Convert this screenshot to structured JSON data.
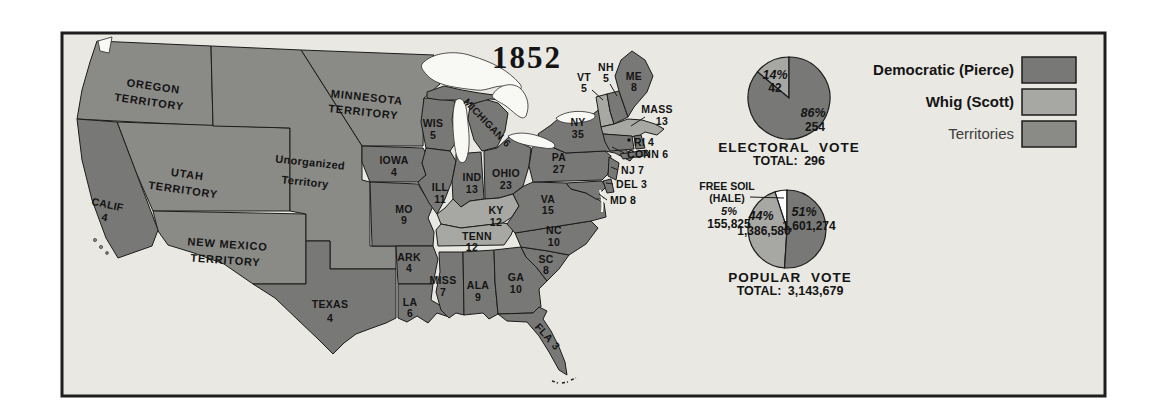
{
  "title": "1852",
  "colors": {
    "democratic": "#787876",
    "whig": "#a7a7a3",
    "territory": "#8a8a86",
    "freesoil": "#ffffff",
    "background": "#e9e8e3",
    "lake": "#f8f8f4",
    "outline": "#1b1b1b"
  },
  "legend": {
    "items": [
      {
        "label": "Democratic (Pierce)",
        "party": "democratic"
      },
      {
        "label": "Whig (Scott)",
        "party": "whig"
      },
      {
        "label": "Territories",
        "party": "territory"
      }
    ]
  },
  "map": {
    "states": {
      "calif": {
        "label": "CALIF",
        "votes": "4",
        "party": "democratic"
      },
      "texas": {
        "label": "TEXAS",
        "votes": "4",
        "party": "democratic"
      },
      "iowa": {
        "label": "IOWA",
        "votes": "4",
        "party": "democratic"
      },
      "wis": {
        "label": "WIS",
        "votes": "5",
        "party": "democratic"
      },
      "ill": {
        "label": "ILL",
        "votes": "11",
        "party": "democratic"
      },
      "mo": {
        "label": "MO",
        "votes": "9",
        "party": "democratic"
      },
      "ark": {
        "label": "ARK",
        "votes": "4",
        "party": "democratic"
      },
      "la": {
        "label": "LA",
        "votes": "6",
        "party": "democratic"
      },
      "miss": {
        "label": "MISS",
        "votes": "7",
        "party": "democratic"
      },
      "ala": {
        "label": "ALA",
        "votes": "9",
        "party": "democratic"
      },
      "ga": {
        "label": "GA",
        "votes": "10",
        "party": "democratic"
      },
      "fla": {
        "label": "FLA",
        "votes": "3",
        "party": "democratic"
      },
      "tenn": {
        "label": "TENN",
        "votes": "12",
        "party": "whig"
      },
      "ky": {
        "label": "KY",
        "votes": "12",
        "party": "whig"
      },
      "mich": {
        "label": "MICHIGAN",
        "votes": "6",
        "party": "democratic"
      },
      "ind": {
        "label": "IND",
        "votes": "13",
        "party": "democratic"
      },
      "ohio": {
        "label": "OHIO",
        "votes": "23",
        "party": "democratic"
      },
      "pa": {
        "label": "PA",
        "votes": "27",
        "party": "democratic"
      },
      "ny": {
        "label": "NY",
        "votes": "35",
        "party": "democratic"
      },
      "va": {
        "label": "VA",
        "votes": "15",
        "party": "democratic"
      },
      "nc": {
        "label": "NC",
        "votes": "10",
        "party": "democratic"
      },
      "sc": {
        "label": "SC",
        "votes": "8",
        "party": "democratic"
      },
      "vt": {
        "label": "VT",
        "votes": "5",
        "party": "whig"
      },
      "nh": {
        "label": "NH",
        "votes": "5",
        "party": "democratic"
      },
      "me": {
        "label": "ME",
        "votes": "8",
        "party": "democratic"
      },
      "mass": {
        "label": "MASS",
        "votes": "13",
        "party": "whig"
      },
      "ri": {
        "label": "RI",
        "votes": "4",
        "party": "democratic"
      },
      "conn": {
        "label": "CONN",
        "votes": "6",
        "party": "democratic"
      },
      "nj": {
        "label": "NJ",
        "votes": "7",
        "party": "democratic"
      },
      "del": {
        "label": "DEL",
        "votes": "3",
        "party": "democratic"
      },
      "md": {
        "label": "MD",
        "votes": "8",
        "party": "democratic"
      }
    },
    "territories": {
      "oregon": {
        "line1": "OREGON",
        "line2": "TERRITORY"
      },
      "minnesota": {
        "line1": "MINNESOTA",
        "line2": "TERRITORY"
      },
      "utah": {
        "line1": "UTAH",
        "line2": "TERRITORY"
      },
      "newmexico": {
        "line1": "NEW MEXICO",
        "line2": "TERRITORY"
      },
      "unorganized": {
        "line1": "Unorganized",
        "line2": "Territory"
      }
    }
  },
  "chart_data": [
    {
      "type": "pie",
      "name": "electoral-vote",
      "title": "ELECTORAL VOTE",
      "total_label": "TOTAL: 296",
      "total": 296,
      "slices": [
        {
          "party": "democratic",
          "label": "Democratic (Pierce)",
          "pct": 86,
          "value": 254,
          "pct_label": "86%",
          "value_label": "254"
        },
        {
          "party": "whig",
          "label": "Whig (Scott)",
          "pct": 14,
          "value": 42,
          "pct_label": "14%",
          "value_label": "42"
        }
      ]
    },
    {
      "type": "pie",
      "name": "popular-vote",
      "title": "POPULAR VOTE",
      "total_label": "TOTAL: 3,143,679",
      "total": 3143679,
      "slices": [
        {
          "party": "democratic",
          "label": "Democratic (Pierce)",
          "pct": 51,
          "value": 1601274,
          "pct_label": "51%",
          "value_label": "1,601,274"
        },
        {
          "party": "whig",
          "label": "Whig (Scott)",
          "pct": 44,
          "value": 1386580,
          "pct_label": "44%",
          "value_label": "1,386,580"
        },
        {
          "party": "freesoil",
          "label": "Free Soil (Hale)",
          "pct": 5,
          "value": 155825,
          "pct_label": "5%",
          "value_label": "155,825",
          "callout_line1": "FREE SOIL",
          "callout_line2": "(HALE)"
        }
      ]
    }
  ]
}
